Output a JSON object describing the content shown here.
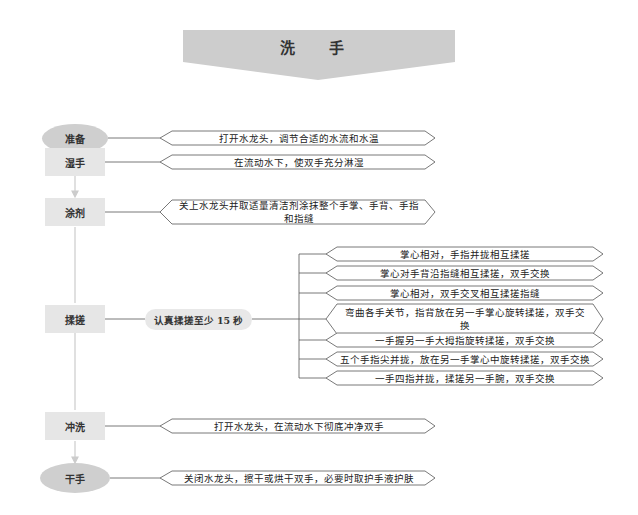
{
  "title": "洗 手",
  "colors": {
    "banner": "#cdcdcd",
    "ellipse_node": "#cfcfcf",
    "rect_node": "#e6e6e6",
    "line": "#555555",
    "arrow": "#c8c8c8"
  },
  "steps": [
    {
      "label": "准备",
      "shape": "ellipse",
      "description": "打开水龙头，调节合适的水流和水温"
    },
    {
      "label": "湿手",
      "shape": "rect",
      "description": "在流动水下，使双手充分淋湿"
    },
    {
      "label": "涂剂",
      "shape": "rect",
      "description": "关上水龙头并取适量清洁剂涂抹整个手掌、手背、手指和指缝"
    },
    {
      "label": "揉搓",
      "shape": "rect",
      "note": "认真揉搓至少 15 秒",
      "substeps": [
        "掌心相对，手指并拢相互揉搓",
        "掌心对手背沿指缝相互揉搓，双手交换",
        "掌心相对，双手交叉相互揉搓指缝",
        "弯曲各手关节，指背放在另一手掌心旋转揉搓，双手交换",
        "一手握另一手大拇指旋转揉搓，双手交换",
        "五个手指尖并拢，放在另一手掌心中旋转揉搓，双手交换",
        "一手四指并拢，揉搓另一手腕，双手交换"
      ]
    },
    {
      "label": "冲洗",
      "shape": "rect",
      "description": "打开水龙头，在流动水下彻底冲净双手"
    },
    {
      "label": "干手",
      "shape": "ellipse",
      "description": "关闭水龙头，擦干或烘干双手，必要时取护手液护肤"
    }
  ]
}
